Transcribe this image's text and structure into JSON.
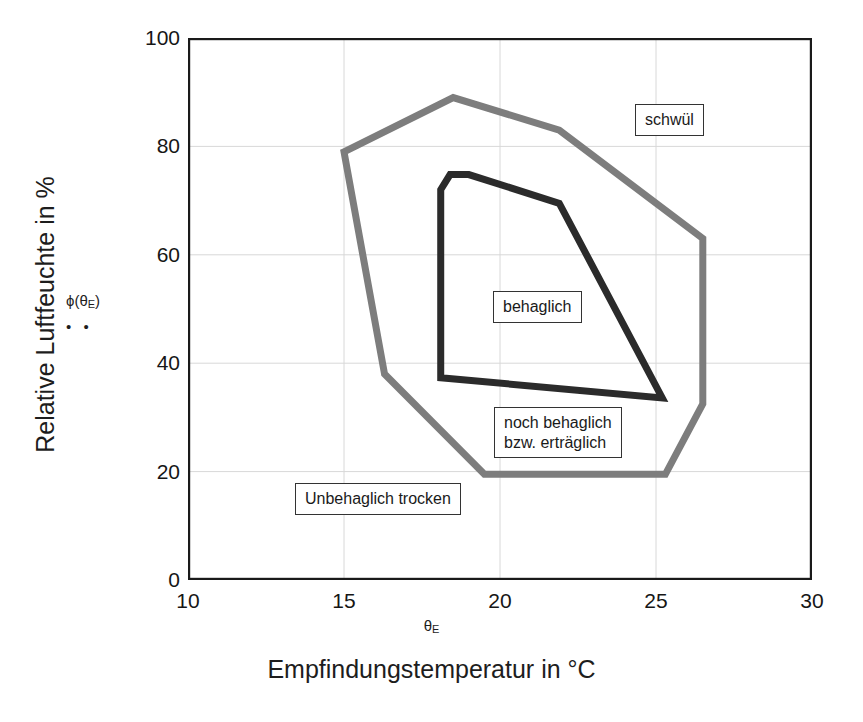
{
  "chart_data": {
    "type": "line",
    "title": "",
    "xlabel": "Empfindungstemperatur in °C",
    "x_symbol": "θ",
    "x_symbol_sub": "E",
    "ylabel": "Relative Luftfeuchte in %",
    "xlim": [
      10,
      30
    ],
    "ylim": [
      0,
      100
    ],
    "xticks": [
      10,
      15,
      20,
      25,
      30
    ],
    "yticks": [
      0,
      20,
      40,
      60,
      80,
      100
    ],
    "grid": true,
    "legend_position": "none",
    "series": [
      {
        "name": "noch behaglich bzw. erträglich",
        "color": "#7d7d7d",
        "closed": true,
        "points": [
          [
            15.0,
            79.0
          ],
          [
            18.5,
            89.0
          ],
          [
            21.9,
            83.0
          ],
          [
            26.5,
            63.0
          ],
          [
            26.5,
            32.5
          ],
          [
            25.3,
            19.5
          ],
          [
            19.5,
            19.5
          ],
          [
            16.3,
            38.0
          ]
        ]
      },
      {
        "name": "behaglich",
        "color": "#2b2b2b",
        "closed": true,
        "points": [
          [
            18.4,
            74.8
          ],
          [
            19.0,
            74.8
          ],
          [
            21.9,
            69.5
          ],
          [
            25.2,
            33.6
          ],
          [
            18.1,
            37.3
          ],
          [
            18.1,
            72.0
          ]
        ]
      }
    ],
    "annotations": [
      {
        "id": "schwuel",
        "text": "schwül",
        "x": 27.0,
        "y": 87.0
      },
      {
        "id": "behaglich",
        "text": "behaglich",
        "x": 21.0,
        "y": 50.5
      },
      {
        "id": "noch",
        "text": "noch behaglich\nbzw. erträglich",
        "x": 21.0,
        "y": 30.0
      },
      {
        "id": "unbehaglich",
        "text": "Unbehaglich trocken",
        "x": 14.5,
        "y": 17.0
      }
    ],
    "markers": {
      "phi_symbol": "ϕ(θ",
      "phi_symbol_sub": "E",
      "phi_symbol_end": ")",
      "phi_dots": "• •"
    }
  },
  "axes": {
    "y_title": "Relative Luftfeuchte in %",
    "x_title": "Empfindungstemperatur in °C",
    "x_axis_symbol": "θ",
    "x_axis_symbol_sub": "E",
    "yticks": [
      "100",
      "80",
      "60",
      "40",
      "20",
      "0"
    ],
    "xticks": [
      "10",
      "15",
      "20",
      "25",
      "30"
    ]
  },
  "annotations": {
    "schwuel": "schwül",
    "behaglich": "behaglich",
    "noch_behaglich_line1": "noch behaglich",
    "noch_behaglich_line2": "bzw. erträglich",
    "unbehaglich_trocken": "Unbehaglich trocken"
  },
  "phi_marker": {
    "symbol_prefix": "ϕ(θ",
    "symbol_sub": "E",
    "symbol_suffix": ")",
    "dots": "• •"
  },
  "colors": {
    "outer_polygon": "#7d7d7d",
    "inner_polygon": "#2b2b2b",
    "frame": "#1a1a1a",
    "grid": "#d8d8d8",
    "background": "#ffffff"
  }
}
